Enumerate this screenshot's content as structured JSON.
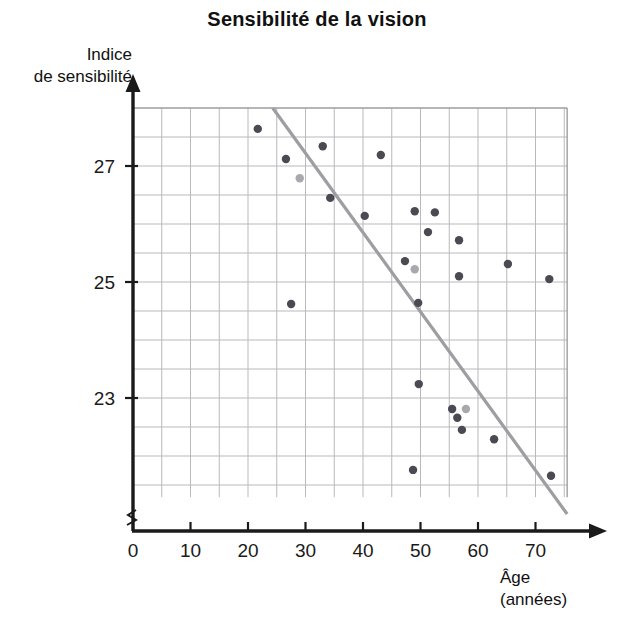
{
  "chart_data": {
    "type": "scatter",
    "title": "Sensibilité de la vision",
    "xlabel": "Âge",
    "xlabel_unit": "(années)",
    "ylabel_line1": "Indice",
    "ylabel_line2": "de sensibilité",
    "xlim": [
      0,
      75.5
    ],
    "ylim": [
      21.2,
      28.15
    ],
    "xticks": [
      0,
      10,
      20,
      30,
      40,
      50,
      60,
      70
    ],
    "xticklabels": [
      "0",
      "10",
      "20",
      "30",
      "40",
      "50",
      "60",
      "70"
    ],
    "yticks": [
      23,
      25,
      27
    ],
    "yticklabels": [
      "23",
      "25",
      "27"
    ],
    "grid": true,
    "grid_x_step": 5,
    "grid_y_step": 0.5,
    "grid_color": "#b9b9bc",
    "axis_color": "#1a1a1a",
    "axis_break": true,
    "point_color": "#4a4a52",
    "point_color_light": "#a8a8ad",
    "point_radius": 4.2,
    "legend": null,
    "legend_position": "none",
    "points": [
      {
        "x": 21.7,
        "y": 27.64,
        "shade": "dark"
      },
      {
        "x": 26.6,
        "y": 27.12,
        "shade": "dark"
      },
      {
        "x": 29.0,
        "y": 26.79,
        "shade": "light"
      },
      {
        "x": 33.0,
        "y": 27.34,
        "shade": "dark"
      },
      {
        "x": 27.5,
        "y": 24.62,
        "shade": "dark"
      },
      {
        "x": 34.3,
        "y": 26.45,
        "shade": "dark"
      },
      {
        "x": 40.3,
        "y": 26.14,
        "shade": "dark"
      },
      {
        "x": 43.1,
        "y": 27.19,
        "shade": "dark"
      },
      {
        "x": 49.0,
        "y": 26.22,
        "shade": "dark"
      },
      {
        "x": 52.5,
        "y": 26.2,
        "shade": "dark"
      },
      {
        "x": 51.3,
        "y": 25.86,
        "shade": "dark"
      },
      {
        "x": 47.3,
        "y": 25.36,
        "shade": "dark"
      },
      {
        "x": 49.0,
        "y": 25.22,
        "shade": "light"
      },
      {
        "x": 56.7,
        "y": 25.72,
        "shade": "dark"
      },
      {
        "x": 56.7,
        "y": 25.1,
        "shade": "dark"
      },
      {
        "x": 65.2,
        "y": 25.31,
        "shade": "dark"
      },
      {
        "x": 72.4,
        "y": 25.05,
        "shade": "dark"
      },
      {
        "x": 49.6,
        "y": 24.64,
        "shade": "dark"
      },
      {
        "x": 49.7,
        "y": 23.24,
        "shade": "dark"
      },
      {
        "x": 55.5,
        "y": 22.81,
        "shade": "dark"
      },
      {
        "x": 57.9,
        "y": 22.81,
        "shade": "light"
      },
      {
        "x": 56.4,
        "y": 22.66,
        "shade": "dark"
      },
      {
        "x": 57.2,
        "y": 22.45,
        "shade": "dark"
      },
      {
        "x": 62.8,
        "y": 22.29,
        "shade": "dark"
      },
      {
        "x": 48.7,
        "y": 21.76,
        "shade": "dark"
      },
      {
        "x": 72.7,
        "y": 21.66,
        "shade": "dark"
      }
    ],
    "trendline": {
      "color": "#9d9da2",
      "width": 3.2,
      "x1": 24.3,
      "y1": 28.0,
      "x2": 75.5,
      "y2": 21.0
    }
  }
}
